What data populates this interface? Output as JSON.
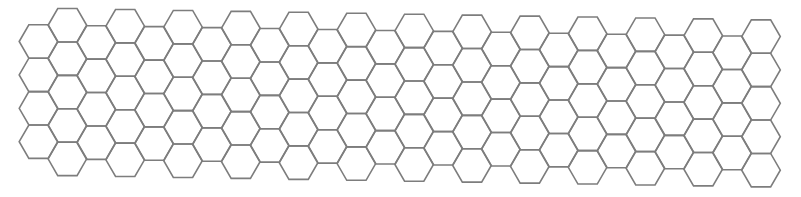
{
  "diagram": {
    "type": "hexagonal-grid",
    "orientation": "flat-top",
    "columns": 26,
    "rows_even_columns": 4,
    "rows_odd_columns": 5,
    "hex_radius": 19.3,
    "column_pitch": 28.9,
    "row_pitch": 33.4,
    "origin_x": 38.5,
    "origin_y": 41.5,
    "odd_column_offset_y": -16.7,
    "y_drift_per_column": 0.47,
    "stroke_color": "#7d7d7d",
    "stroke_width": 1.6,
    "background": "#ffffff"
  }
}
